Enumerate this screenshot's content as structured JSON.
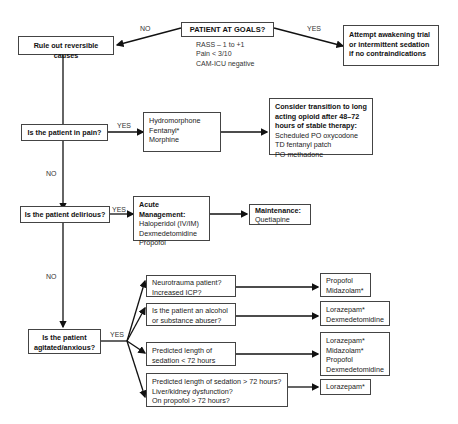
{
  "nodes": {
    "goals": {
      "title": "PATIENT AT GOALS?",
      "criteria": [
        "RASS – 1 to +1",
        "Pain < 3/10",
        "CAM-ICU negative"
      ]
    },
    "reversible": {
      "title": "Rule out reversible causes"
    },
    "awakening": {
      "lines": [
        "Attempt awakening trial",
        "or intermittent sedation",
        "if no contraindications"
      ]
    },
    "pain": {
      "title": "Is the patient in pain?"
    },
    "pain_meds": {
      "lines": [
        "Hydromorphone",
        "Fentanyl*",
        "Morphine"
      ]
    },
    "long_acting": {
      "heading": [
        "Consider transition to long",
        "acting opioid after 48–72",
        "hours of stable therapy:"
      ],
      "lines": [
        "Scheduled PO oxycodone",
        "TD fentanyl patch",
        "PO methadone"
      ]
    },
    "delirious": {
      "title": "Is the patient delirious?"
    },
    "acute": {
      "heading": "Acute Management:",
      "lines": [
        "Haloperidol (IV/IM)",
        "Dexmedetomidine",
        "Propofol"
      ]
    },
    "maintenance": {
      "heading": "Maintenance:",
      "lines": [
        "Quetiapine"
      ]
    },
    "agitated": {
      "title_lines": [
        "Is the patient",
        "agitated/anxious?"
      ]
    },
    "cond1": {
      "lines": [
        "Neurotrauma patient?",
        "Increased ICP?"
      ]
    },
    "cond2": {
      "lines": [
        "Is the patient an alcohol",
        "or substance abuser?"
      ]
    },
    "cond3": {
      "lines": [
        "Predicted length of",
        "sedation < 72 hours"
      ]
    },
    "cond4": {
      "lines": [
        "Predicted length of sedation > 72 hours?",
        "Liver/kidney dysfunction?",
        "On propofol > 72 hours?"
      ]
    },
    "res1": {
      "lines": [
        "Propofol",
        "Midazolam*"
      ]
    },
    "res2": {
      "lines": [
        "Lorazepam*",
        "Dexmedetomidine"
      ]
    },
    "res3": {
      "lines": [
        "Lorazepam*",
        "Midazolam*",
        "Propofol",
        "Dexmedetomidine"
      ]
    },
    "res4": {
      "lines": [
        "Lorazepam*"
      ]
    }
  },
  "edge_labels": {
    "goals_no": "NO",
    "goals_yes": "YES",
    "pain_yes": "YES",
    "pain_no": "NO",
    "delirious_yes": "YES",
    "delirious_no": "NO",
    "agitated_yes": "YES"
  },
  "colors": {
    "line": "#111111",
    "border": "#444444",
    "background": "#ffffff"
  }
}
